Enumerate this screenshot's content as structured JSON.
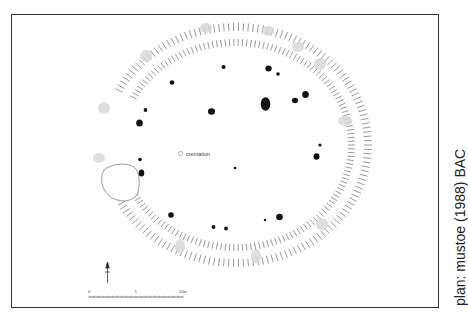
{
  "figure": {
    "credit": "plan: mustoe (1988) BAC",
    "features": {
      "cremation_label": "cremation"
    },
    "scale_bar": {
      "ticks": [
        "0",
        "5",
        "10m"
      ]
    },
    "north_arrow": "north-arrow",
    "colors": {
      "ink": "#111111",
      "ditch_hatch": "#555555",
      "causeway_shade": "#cccccc",
      "frame": "#333333",
      "background": "#ffffff"
    }
  }
}
